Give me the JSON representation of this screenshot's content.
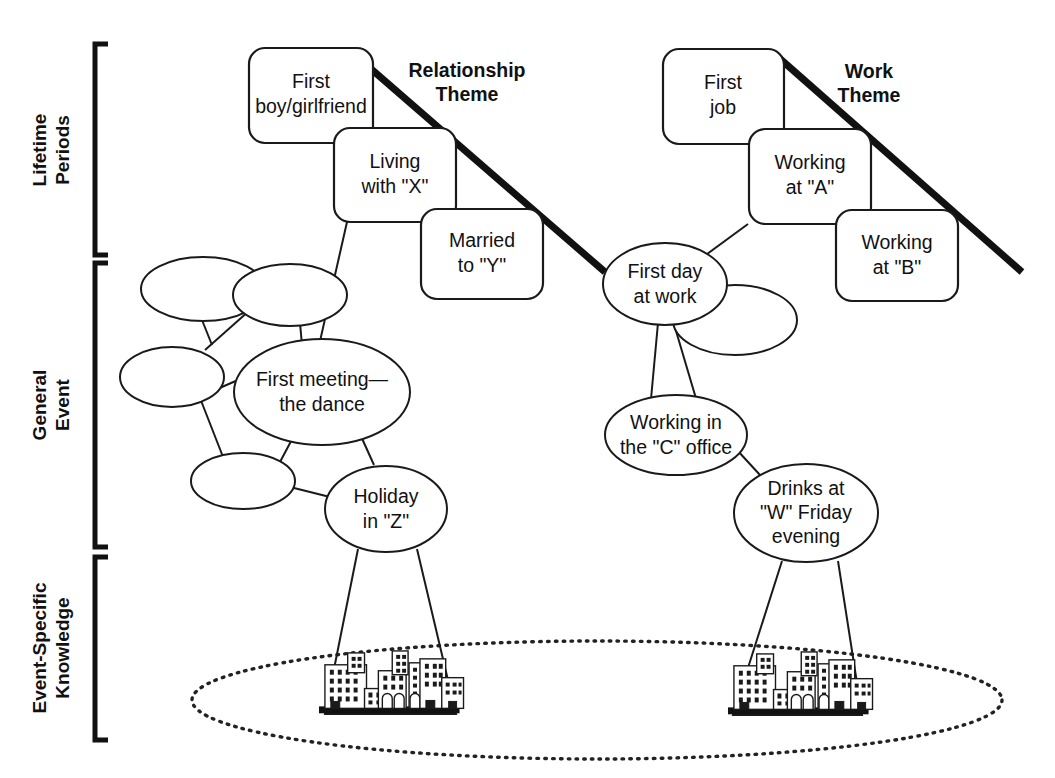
{
  "figure": {
    "title_present": false,
    "axis_labels": [
      {
        "id": "lifetime-periods",
        "line1": "Lifetime",
        "line2": "Periods"
      },
      {
        "id": "general-event",
        "line1": "General",
        "line2": "Event"
      },
      {
        "id": "event-specific-knowledge",
        "line1": "Event-Specific",
        "line2": "Knowledge"
      }
    ],
    "themes": [
      {
        "id": "relationship-theme",
        "line1": "Relationship",
        "line2": "Theme"
      },
      {
        "id": "work-theme",
        "line1": "Work",
        "line2": "Theme"
      }
    ],
    "lifetime_boxes": {
      "relationship": [
        {
          "id": "first-boyfriend-girlfriend",
          "line1": "First",
          "line2": "boy/girlfriend"
        },
        {
          "id": "living-with-x",
          "line1": "Living",
          "line2": "with \"X\""
        },
        {
          "id": "married-to-y",
          "line1": "Married",
          "line2": "to \"Y\""
        }
      ],
      "work": [
        {
          "id": "first-job",
          "line1": "First",
          "line2": "job"
        },
        {
          "id": "working-at-a",
          "line1": "Working",
          "line2": "at \"A\""
        },
        {
          "id": "working-at-b",
          "line1": "Working",
          "line2": "at \"B\""
        }
      ]
    },
    "general_events": {
      "relationship": [
        {
          "id": "first-meeting-the-dance",
          "line1": "First meeting—",
          "line2": "the dance",
          "line3": ""
        },
        {
          "id": "holiday-in-z",
          "line1": "Holiday",
          "line2": "in \"Z\"",
          "line3": ""
        },
        {
          "id": "unlabeled-event-1",
          "line1": "",
          "line2": "",
          "line3": ""
        },
        {
          "id": "unlabeled-event-2",
          "line1": "",
          "line2": "",
          "line3": ""
        },
        {
          "id": "unlabeled-event-3",
          "line1": "",
          "line2": "",
          "line3": ""
        },
        {
          "id": "unlabeled-event-4",
          "line1": "",
          "line2": "",
          "line3": ""
        }
      ],
      "work": [
        {
          "id": "first-day-at-work",
          "line1": "First day",
          "line2": "at work",
          "line3": ""
        },
        {
          "id": "working-in-the-c-office",
          "line1": "Working in",
          "line2": "the \"C\" office",
          "line3": ""
        },
        {
          "id": "drinks-at-w-friday-evening",
          "line1": "Drinks at",
          "line2": "\"W\" Friday",
          "line3": "evening"
        },
        {
          "id": "unlabeled-work-event-1",
          "line1": "",
          "line2": "",
          "line3": ""
        }
      ]
    },
    "event_specific": [
      {
        "id": "cityscape-relationship",
        "caption": ""
      },
      {
        "id": "cityscape-work",
        "caption": ""
      }
    ],
    "colors": {
      "ink": "#111111",
      "stroke": "#1a1a1a",
      "background": "#ffffff"
    }
  }
}
